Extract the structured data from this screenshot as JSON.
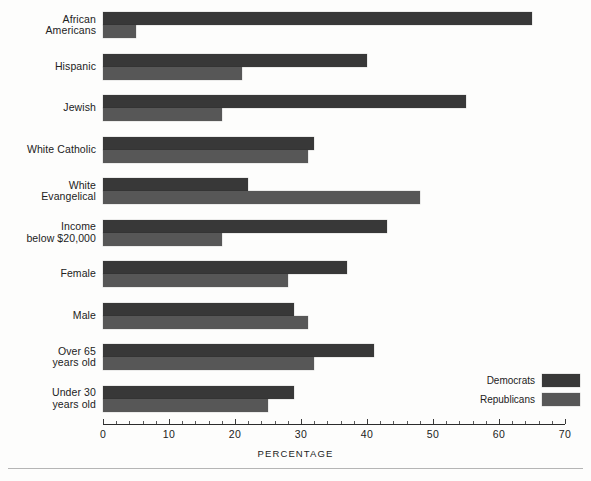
{
  "chart_data": {
    "type": "bar",
    "orientation": "horizontal",
    "title": "",
    "xlabel": "PERCENTAGE",
    "ylabel": "",
    "xlim": [
      0,
      70
    ],
    "xticks": [
      0,
      10,
      20,
      30,
      40,
      50,
      60,
      70
    ],
    "xtick_labels": [
      "0",
      "10",
      "20",
      "30",
      "40",
      "50",
      "60",
      "70"
    ],
    "minor_tick_step": 2,
    "grid": false,
    "legend_position": "bottom-right",
    "categories": [
      "African Americans",
      "Hispanic",
      "Jewish",
      "White Catholic",
      "White Evangelical",
      "Income below $20,000",
      "Female",
      "Male",
      "Over 65 years old",
      "Under 30 years old"
    ],
    "category_label_lines": [
      [
        "African",
        "Americans"
      ],
      [
        "Hispanic"
      ],
      [
        "Jewish"
      ],
      [
        "White Catholic"
      ],
      [
        "White",
        "Evangelical"
      ],
      [
        "Income",
        "below $20,000"
      ],
      [
        "Female"
      ],
      [
        "Male"
      ],
      [
        "Over 65",
        "years old"
      ],
      [
        "Under 30",
        "years old"
      ]
    ],
    "series": [
      {
        "name": "Democrats",
        "color": "#383838",
        "values": [
          65,
          40,
          55,
          32,
          22,
          43,
          37,
          29,
          41,
          29
        ]
      },
      {
        "name": "Republicans",
        "color": "#575757",
        "values": [
          5,
          21,
          18,
          31,
          48,
          18,
          28,
          31,
          32,
          25
        ]
      }
    ]
  },
  "legend": {
    "items": [
      {
        "label": "Democrats",
        "color": "#383838"
      },
      {
        "label": "Republicans",
        "color": "#575757"
      }
    ]
  },
  "axis": {
    "title": "PERCENTAGE"
  },
  "colors": {
    "democrat": "#383838",
    "republican": "#575757",
    "axis": "#2b2b2b",
    "text": "#222222",
    "background": "#fdfdfc",
    "footer_rule": "#b5b5b5"
  }
}
